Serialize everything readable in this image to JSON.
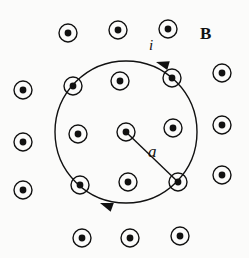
{
  "figure": {
    "background_color": "#fbfbfa",
    "ink_color": "#111111"
  },
  "labels": {
    "field_label": "B",
    "current_label": "i",
    "radius_label": "a"
  },
  "loop": {
    "name": "current-loop",
    "center_x": 126,
    "center_y": 132,
    "radius": 71,
    "stroke_width": 1.4,
    "current_direction": "counterclockwise"
  },
  "radius_line": {
    "from_x": 126,
    "from_y": 132,
    "to_x": 178,
    "to_y": 182,
    "stroke_width": 1.4
  },
  "arrows": [
    {
      "name": "current-arrow-top",
      "x": 156,
      "y": 62,
      "angle_deg": 196
    },
    {
      "name": "current-arrow-bottom",
      "x": 100,
      "y": 203,
      "angle_deg": 200
    }
  ],
  "field_symbol": {
    "type": "dot-in-circle",
    "meaning": "magnetic field out of the page",
    "outer_radius": 9,
    "inner_radius": 3.4,
    "ring_stroke_width": 1.4
  },
  "field_dots": [
    {
      "x": 68,
      "y": 33,
      "region": "outside"
    },
    {
      "x": 118,
      "y": 30,
      "region": "outside"
    },
    {
      "x": 168,
      "y": 29,
      "region": "outside"
    },
    {
      "x": 23,
      "y": 90,
      "region": "outside"
    },
    {
      "x": 222,
      "y": 73,
      "region": "outside"
    },
    {
      "x": 23,
      "y": 142,
      "region": "outside"
    },
    {
      "x": 222,
      "y": 125,
      "region": "outside"
    },
    {
      "x": 23,
      "y": 190,
      "region": "outside"
    },
    {
      "x": 222,
      "y": 175,
      "region": "outside"
    },
    {
      "x": 82,
      "y": 238,
      "region": "outside"
    },
    {
      "x": 130,
      "y": 238,
      "region": "outside"
    },
    {
      "x": 180,
      "y": 236,
      "region": "outside"
    },
    {
      "x": 73,
      "y": 86,
      "region": "on-loop"
    },
    {
      "x": 172,
      "y": 78,
      "region": "on-loop"
    },
    {
      "x": 80,
      "y": 185,
      "region": "on-loop"
    },
    {
      "x": 178,
      "y": 182,
      "region": "on-loop"
    },
    {
      "x": 120,
      "y": 81,
      "region": "inside"
    },
    {
      "x": 78,
      "y": 134,
      "region": "inside"
    },
    {
      "x": 126,
      "y": 132,
      "region": "inside-center"
    },
    {
      "x": 173,
      "y": 128,
      "region": "inside"
    },
    {
      "x": 128,
      "y": 182,
      "region": "inside"
    }
  ],
  "label_positions": {
    "field": {
      "x": 200,
      "y": 25
    },
    "current": {
      "x": 149,
      "y": 38
    },
    "radius": {
      "x": 148,
      "y": 143
    }
  }
}
